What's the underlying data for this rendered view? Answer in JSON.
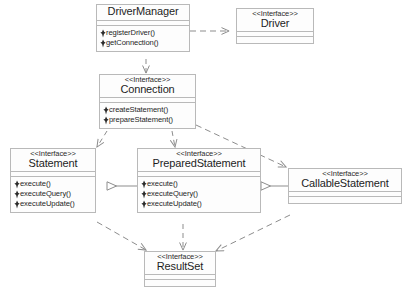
{
  "diagram": {
    "stereotype_label": "<<Interface>>",
    "colors": {
      "box_border": "#b9b9b9",
      "box_fill": "#fdfdfd",
      "line": "#8d8d8d",
      "text": "#1d1d1d"
    },
    "classes": [
      {
        "id": "driver-manager",
        "name": "DriverManager",
        "stereotype": "",
        "operations": [
          "registerDriver()",
          "getConnection()"
        ]
      },
      {
        "id": "driver",
        "name": "Driver",
        "stereotype": "<<Interface>>",
        "operations": []
      },
      {
        "id": "connection",
        "name": "Connection",
        "stereotype": "<<Interface>>",
        "operations": [
          "createStatement()",
          "prepareStatement()"
        ]
      },
      {
        "id": "statement",
        "name": "Statement",
        "stereotype": "<<Interface>>",
        "operations": [
          "execute()",
          "executeQuery()",
          "executeUpdate()"
        ]
      },
      {
        "id": "prepared-statement",
        "name": "PreparedStatement",
        "stereotype": "<<Interface>>",
        "operations": [
          "execute()",
          "executeQuery()",
          "executeUpdate()"
        ]
      },
      {
        "id": "callable-statement",
        "name": "CallableStatement",
        "stereotype": "<<Interface>>",
        "operations": []
      },
      {
        "id": "result-set",
        "name": "ResultSet",
        "stereotype": "<<Interface>>",
        "operations": []
      }
    ],
    "relationships": [
      {
        "from": "DriverManager",
        "to": "Driver",
        "type": "dependency"
      },
      {
        "from": "DriverManager",
        "to": "Connection",
        "type": "dependency"
      },
      {
        "from": "Connection",
        "to": "Statement",
        "type": "dependency"
      },
      {
        "from": "Connection",
        "to": "PreparedStatement",
        "type": "dependency"
      },
      {
        "from": "Connection",
        "to": "CallableStatement",
        "type": "dependency"
      },
      {
        "from": "PreparedStatement",
        "to": "Statement",
        "type": "generalization"
      },
      {
        "from": "CallableStatement",
        "to": "PreparedStatement",
        "type": "generalization"
      },
      {
        "from": "Statement",
        "to": "ResultSet",
        "type": "dependency"
      },
      {
        "from": "PreparedStatement",
        "to": "ResultSet",
        "type": "dependency"
      },
      {
        "from": "CallableStatement",
        "to": "ResultSet",
        "type": "dependency"
      }
    ]
  }
}
